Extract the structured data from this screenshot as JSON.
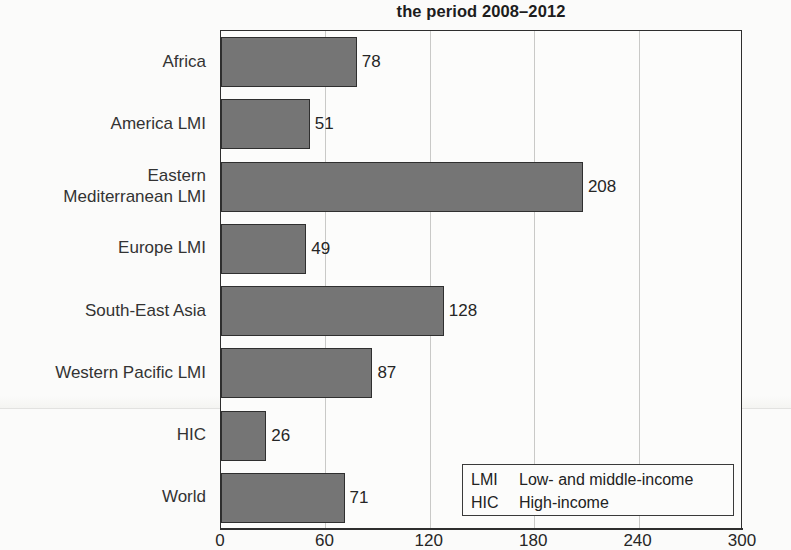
{
  "chart_data": {
    "type": "bar",
    "orientation": "horizontal",
    "title": "the period 2008–2012",
    "xlabel": "",
    "ylabel": "",
    "xlim": [
      0,
      300
    ],
    "xticks": [
      "0",
      "60",
      "120",
      "180",
      "240",
      "300"
    ],
    "grid": true,
    "bar_color": "#757575",
    "categories": [
      "Africa",
      "America LMI",
      "Eastern\nMediterranean LMI",
      "Europe LMI",
      "South-East Asia",
      "Western Pacific LMI",
      "HIC",
      "World"
    ],
    "values": [
      78,
      51,
      208,
      49,
      128,
      87,
      26,
      71
    ],
    "value_labels": [
      "78",
      "51",
      "208",
      "49",
      "128",
      "87",
      "26",
      "71"
    ],
    "legend": {
      "position": "inside-bottom-right",
      "rows": [
        {
          "key": "LMI",
          "desc": "Low- and middle-income"
        },
        {
          "key": "HIC",
          "desc": "High-income"
        }
      ]
    }
  }
}
